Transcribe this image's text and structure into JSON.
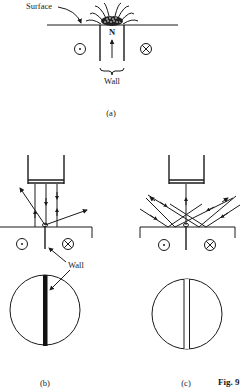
{
  "figure": {
    "number_label": "Fig. 9",
    "panels": [
      {
        "id": "a",
        "caption": "(a)",
        "labels": {
          "surface": "Surface",
          "domain_pole": "N",
          "wall": "Wall"
        },
        "symbols": [
          "field-out-of-page",
          "field-into-page"
        ]
      },
      {
        "id": "b",
        "caption": "(b)",
        "labels": {
          "wall": "Wall"
        },
        "symbols": [
          "field-out-of-page",
          "field-into-page"
        ],
        "image_view": "dark wall line on bright field"
      },
      {
        "id": "c",
        "caption": "(c)",
        "symbols": [
          "field-out-of-page",
          "field-into-page"
        ],
        "image_view": "bright wall line on dark field"
      }
    ]
  },
  "colors": {
    "ink": "#1a1a1a",
    "dark_field": "#c8c8c8",
    "background": "#ffffff"
  }
}
